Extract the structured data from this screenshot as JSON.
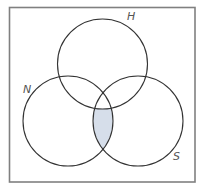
{
  "diagram": {
    "type": "venn",
    "sets": [
      {
        "id": "H",
        "label": "H",
        "cx": 102.5,
        "cy": 64,
        "r": 45
      },
      {
        "id": "N",
        "label": "N",
        "cx": 68,
        "cy": 121,
        "r": 45
      },
      {
        "id": "S",
        "label": "S",
        "cx": 138,
        "cy": 121,
        "r": 45
      }
    ],
    "shaded_region": "N ∩ S minus H",
    "colors": {
      "border": "#808080",
      "circle_stroke": "#333333",
      "shade_fill": "#d6deea",
      "label": "#555555",
      "background": "#ffffff"
    }
  },
  "labels": {
    "H": "H",
    "N": "N",
    "S": "S"
  }
}
